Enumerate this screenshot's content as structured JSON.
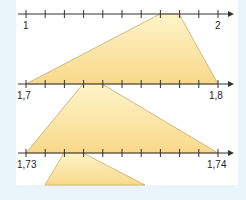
{
  "colors": {
    "background": "#eaf5fb",
    "panel": "#ffffff",
    "axis": "#333333",
    "zoom_fill": "#fbe39a",
    "zoom_stroke": "#c9a96a"
  },
  "number_lines": [
    {
      "start_label": "1",
      "end_label": "2",
      "ticks": 10,
      "zoom_interval": [
        7,
        8
      ]
    },
    {
      "start_label": "1,7",
      "end_label": "1,8",
      "ticks": 10,
      "zoom_interval": [
        3,
        4
      ]
    },
    {
      "start_label": "1,73",
      "end_label": "1,74",
      "ticks": 10,
      "zoom_interval": [
        2,
        3
      ]
    }
  ]
}
